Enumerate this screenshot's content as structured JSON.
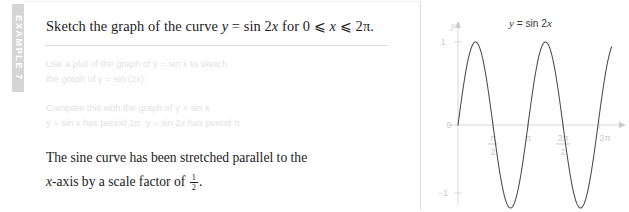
{
  "example_tab": {
    "label": "EXAMPLE 7"
  },
  "question": {
    "prefix": "Sketch the graph of the curve ",
    "y_var": "y",
    "equals": " = sin 2",
    "x_var": "x",
    "range_text": " for 0 ⩽ ",
    "x_var2": "x",
    "range_end": " ⩽ 2π.",
    "full_text": "Sketch the graph of the curve y = sin 2x for 0 ⩽ x ⩽ 2π."
  },
  "faded_notes": {
    "block1": [
      "Use a plot of the graph of y = sin x to sketch",
      "the graph of y = sin (2x):"
    ],
    "block2": [
      "Compare this with the graph of y = sin x",
      "y = sin x has period 2π. y = sin 2x has period π."
    ]
  },
  "conclusion": {
    "line1": "The sine curve has been stretched parallel to the",
    "line2_pre": "-axis by a scale factor of ",
    "line2_xvar": "x",
    "fraction_numerator": "1",
    "fraction_denominator": "2",
    "line2_end": "."
  },
  "chart_data": {
    "type": "line",
    "title": "y = sin 2x",
    "xlabel": "x",
    "ylabel": "y",
    "function": "y = sin(2x)",
    "xlim": [
      0,
      6.9
    ],
    "ylim": [
      -1.12,
      1.12
    ],
    "grid": false,
    "legend": "none",
    "x_tick_labels": [
      "π/2",
      "π",
      "3π/2",
      "2π"
    ],
    "x_tick_values": [
      1.5707963,
      3.1415927,
      4.712389,
      6.2831853
    ],
    "y_tick_labels": [
      "1",
      "0",
      "−1"
    ],
    "y_tick_values": [
      1,
      0,
      -1
    ],
    "axis_origin_label": "0",
    "x_axis_arrow": true,
    "y_axis_arrow": true,
    "curve_color": "#4a4a4a",
    "axis_color": "#d8d8d8",
    "tick_label_color": "#c9c9c9",
    "key_points": {
      "zeros": [
        0,
        1.5707963,
        3.1415927,
        4.712389,
        6.2831853
      ],
      "maxima_x": [
        0.7853982,
        3.9269908
      ],
      "maxima_y": [
        1,
        1
      ],
      "minima_x": [
        2.3561945,
        5.4977871
      ],
      "minima_y": [
        -1,
        -1
      ]
    },
    "samples_x": [
      0,
      0.2,
      0.4,
      0.6,
      0.8,
      1.0,
      1.2,
      1.4,
      1.6,
      1.8,
      2.0,
      2.2,
      2.4,
      2.6,
      2.8,
      3.0,
      3.2,
      3.4,
      3.6,
      3.8,
      4.0,
      4.2,
      4.4,
      4.6,
      4.8,
      5.0,
      5.2,
      5.4,
      5.6,
      5.8,
      6.0,
      6.2,
      6.4,
      6.6,
      6.8
    ],
    "samples_y": [
      0.0,
      0.389,
      0.717,
      0.932,
      0.9996,
      0.909,
      0.675,
      0.335,
      -0.058,
      -0.443,
      -0.757,
      -0.951,
      -0.996,
      -0.884,
      -0.631,
      -0.279,
      0.117,
      0.493,
      0.793,
      0.969,
      0.989,
      0.855,
      0.585,
      0.221,
      -0.174,
      -0.544,
      -0.825,
      -0.983,
      -0.98,
      -0.823,
      -0.537,
      -0.163,
      0.232,
      0.594,
      0.86
    ]
  }
}
